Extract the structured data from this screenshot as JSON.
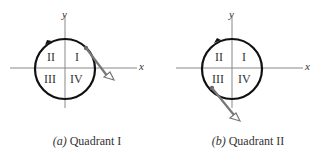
{
  "figures": [
    {
      "id": "a",
      "caption_letter": "(a)",
      "caption_text": "Quadrant I",
      "axis_labels": {
        "x": "x",
        "y": "y"
      },
      "quadrants": {
        "q1": "I",
        "q2": "II",
        "q3": "III",
        "q4": "IV"
      },
      "rotation": "counterclockwise",
      "release_point": "upper-right"
    },
    {
      "id": "b",
      "caption_letter": "(b)",
      "caption_text": "Quadrant II",
      "axis_labels": {
        "x": "x",
        "y": "y"
      },
      "quadrants": {
        "q1": "I",
        "q2": "II",
        "q3": "III",
        "q4": "IV"
      },
      "rotation": "counterclockwise",
      "release_point": "lower-left"
    }
  ],
  "colors": {
    "circle": "#111111",
    "axes": "#888888",
    "tangent": "#777777",
    "text": "#333333"
  }
}
